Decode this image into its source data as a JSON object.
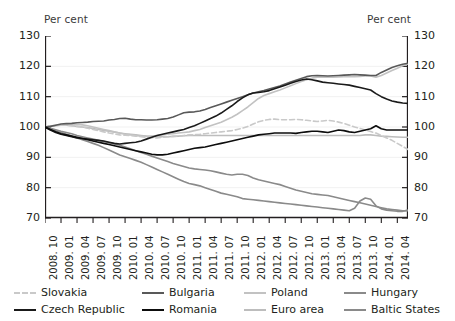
{
  "axis_titles": {
    "left": "Per cent",
    "right": "Per cent"
  },
  "legend": {
    "items": [
      {
        "label": "Slovakia",
        "color": "#c9c9c9",
        "dash": true,
        "row": 0,
        "col": 0
      },
      {
        "label": "Bulgaria",
        "color": "#595959",
        "dash": false,
        "row": 0,
        "col": 1
      },
      {
        "label": "Poland",
        "color": "#c2c2c2",
        "dash": false,
        "row": 0,
        "col": 2
      },
      {
        "label": "Hungary",
        "color": "#8a8a8a",
        "dash": false,
        "row": 0,
        "col": 3
      },
      {
        "label": "Czech Republic",
        "color": "#1a1a1a",
        "dash": false,
        "row": 1,
        "col": 0
      },
      {
        "label": "Romania",
        "color": "#0d0d0d",
        "dash": false,
        "row": 1,
        "col": 1
      },
      {
        "label": "Euro area",
        "color": "#bdbdbd",
        "dash": false,
        "row": 1,
        "col": 2
      },
      {
        "label": "Baltic States",
        "color": "#8a8a8a",
        "dash": false,
        "row": 1,
        "col": 3
      }
    ]
  },
  "chart_data": {
    "type": "line",
    "title": "",
    "xlabel": "",
    "ylabel": "Per cent",
    "ylim": [
      70,
      130
    ],
    "yticks": [
      70,
      80,
      90,
      100,
      110,
      120,
      130
    ],
    "grid": true,
    "legend_position": "bottom",
    "x": [
      "2008. 10",
      "2008. 11",
      "2008. 12",
      "2009. 01",
      "2009. 02",
      "2009. 03",
      "2009. 04",
      "2009. 05",
      "2009. 06",
      "2009. 07",
      "2009. 08",
      "2009. 09",
      "2009. 10",
      "2009. 11",
      "2009. 12",
      "2010. 01",
      "2010. 02",
      "2010. 03",
      "2010. 04",
      "2010. 05",
      "2010. 06",
      "2010. 07",
      "2010. 08",
      "2010. 09",
      "2010. 10",
      "2010. 11",
      "2010. 12",
      "2011. 01",
      "2011. 02",
      "2011. 03",
      "2011. 04",
      "2011. 05",
      "2011. 06",
      "2011. 07",
      "2011. 08",
      "2011. 09",
      "2011. 10",
      "2011. 11",
      "2011. 12",
      "2012. 01",
      "2012. 02",
      "2012. 03",
      "2012. 04",
      "2012. 05",
      "2012. 06",
      "2012. 07",
      "2012. 08",
      "2012. 09",
      "2012. 10",
      "2012. 11",
      "2012. 12",
      "2013. 01",
      "2013. 02",
      "2013. 03",
      "2013. 04",
      "2013. 05",
      "2013. 06",
      "2013. 07",
      "2013. 08",
      "2013. 09",
      "2013. 10",
      "2013. 11",
      "2013. 12",
      "2014. 01",
      "2014. 02",
      "2014. 03",
      "2014. 04",
      "2014. 05",
      "2014. 06"
    ],
    "xtick_labels": [
      "2008. 10",
      "2009. 01",
      "2009. 04",
      "2009. 07",
      "2009. 10",
      "2010. 01",
      "2010. 04",
      "2010. 07",
      "2010. 10",
      "2011. 01",
      "2011. 04",
      "2011. 07",
      "2011. 10",
      "2012. 01",
      "2012. 04",
      "2012. 07",
      "2012. 10",
      "2013. 01",
      "2013. 04",
      "2013. 07",
      "2013. 10",
      "2014. 01",
      "2014. 04"
    ],
    "xtick_indices": [
      0,
      3,
      6,
      9,
      12,
      15,
      18,
      21,
      24,
      27,
      30,
      33,
      36,
      39,
      42,
      45,
      48,
      51,
      54,
      57,
      60,
      63,
      66
    ],
    "series": [
      {
        "name": "Slovakia",
        "color": "#c9c9c9",
        "dash": true,
        "values": [
          100.0,
          100.3,
          100.6,
          100.7,
          100.6,
          100.4,
          100.2,
          100.0,
          99.6,
          99.2,
          98.8,
          98.4,
          98.0,
          97.7,
          97.4,
          97.3,
          97.2,
          97.0,
          96.8,
          96.6,
          96.5,
          96.4,
          96.6,
          96.8,
          96.9,
          97.0,
          97.2,
          97.4,
          97.5,
          97.6,
          97.8,
          98.0,
          98.2,
          98.4,
          98.6,
          98.8,
          99.2,
          99.6,
          100.2,
          101.0,
          101.7,
          102.2,
          102.5,
          102.6,
          102.4,
          102.4,
          102.4,
          102.5,
          102.4,
          102.2,
          102.0,
          101.8,
          102.0,
          102.2,
          102.0,
          101.6,
          101.2,
          100.6,
          100.0,
          99.5,
          99.0,
          98.5,
          98.0,
          97.2,
          96.4,
          95.6,
          94.6,
          93.6,
          92.6
        ]
      },
      {
        "name": "Bulgaria",
        "color": "#595959",
        "dash": false,
        "values": [
          100.0,
          100.2,
          100.6,
          101.0,
          101.1,
          101.2,
          101.4,
          101.5,
          101.6,
          101.8,
          101.9,
          102.0,
          102.3,
          102.5,
          102.8,
          102.9,
          102.6,
          102.4,
          102.4,
          102.3,
          102.3,
          102.4,
          102.6,
          102.8,
          103.3,
          104.0,
          104.7,
          104.9,
          105.0,
          105.3,
          105.8,
          106.4,
          107.0,
          107.6,
          108.2,
          108.8,
          109.4,
          110.0,
          110.6,
          111.2,
          111.6,
          112.0,
          112.5,
          113.0,
          113.5,
          114.2,
          114.8,
          115.4,
          116.0,
          116.6,
          116.9,
          117.0,
          116.9,
          116.8,
          116.9,
          117.0,
          117.1,
          117.2,
          117.3,
          117.2,
          117.1,
          117.0,
          117.0,
          118.0,
          118.8,
          119.6,
          120.2,
          120.7,
          121.0
        ]
      },
      {
        "name": "Poland",
        "color": "#c2c2c2",
        "dash": false,
        "values": [
          100.0,
          100.2,
          100.4,
          100.6,
          100.7,
          100.8,
          100.8,
          100.7,
          100.4,
          100.0,
          99.6,
          99.2,
          98.8,
          98.4,
          98.0,
          97.6,
          97.4,
          97.2,
          97.0,
          96.9,
          97.0,
          97.2,
          97.4,
          97.6,
          97.8,
          98.0,
          98.2,
          98.4,
          98.8,
          99.2,
          99.8,
          100.4,
          101.0,
          101.6,
          102.4,
          103.2,
          104.2,
          105.4,
          106.6,
          108.0,
          109.4,
          110.4,
          111.0,
          111.6,
          112.2,
          112.9,
          113.6,
          114.3,
          115.0,
          115.6,
          116.1,
          116.4,
          116.5,
          116.4,
          116.4,
          116.5,
          116.6,
          116.6,
          116.6,
          116.7,
          116.8,
          116.8,
          116.4,
          117.0,
          117.8,
          118.6,
          119.4,
          120.2,
          120.8
        ]
      },
      {
        "name": "Hungary",
        "color": "#8a8a8a",
        "dash": false,
        "values": [
          100.0,
          99.6,
          99.1,
          98.6,
          98.2,
          97.8,
          97.2,
          96.8,
          96.4,
          96.0,
          95.6,
          95.2,
          94.8,
          94.4,
          94.0,
          93.4,
          92.8,
          92.2,
          91.6,
          91.0,
          90.4,
          89.8,
          89.2,
          88.6,
          88.0,
          87.5,
          87.0,
          86.5,
          86.2,
          86.0,
          85.8,
          85.6,
          85.2,
          84.8,
          84.4,
          84.2,
          84.4,
          84.4,
          84.0,
          83.2,
          82.6,
          82.2,
          81.8,
          81.4,
          81.0,
          80.4,
          79.8,
          79.2,
          78.8,
          78.4,
          78.0,
          77.8,
          77.6,
          77.4,
          77.0,
          76.6,
          76.2,
          75.8,
          75.4,
          75.0,
          74.6,
          74.2,
          73.8,
          73.4,
          73.0,
          72.8,
          72.6,
          72.4,
          72.4
        ]
      },
      {
        "name": "Czech Republic",
        "color": "#1a1a1a",
        "dash": false,
        "values": [
          100.0,
          99.0,
          98.2,
          97.6,
          97.2,
          96.8,
          96.4,
          96.2,
          96.0,
          95.8,
          95.6,
          95.4,
          95.0,
          94.6,
          94.4,
          94.6,
          94.8,
          95.0,
          95.4,
          96.0,
          96.6,
          97.2,
          97.6,
          98.0,
          98.4,
          98.8,
          99.2,
          99.8,
          100.4,
          101.2,
          102.0,
          102.8,
          103.6,
          104.6,
          105.8,
          107.0,
          108.4,
          109.6,
          110.6,
          111.2,
          111.4,
          111.6,
          112.0,
          112.6,
          113.2,
          113.8,
          114.4,
          115.0,
          115.5,
          115.8,
          115.6,
          115.2,
          114.8,
          114.6,
          114.4,
          114.2,
          114.0,
          113.8,
          113.4,
          113.0,
          112.6,
          112.2,
          111.0,
          110.0,
          109.2,
          108.6,
          108.2,
          107.9,
          107.8
        ]
      },
      {
        "name": "Romania",
        "color": "#0d0d0d",
        "dash": false,
        "values": [
          100.0,
          99.2,
          98.4,
          97.8,
          97.4,
          97.0,
          96.6,
          96.2,
          95.8,
          95.4,
          95.0,
          94.6,
          94.2,
          93.8,
          93.4,
          93.0,
          92.6,
          92.2,
          91.8,
          91.4,
          91.0,
          90.8,
          90.8,
          91.0,
          91.4,
          91.8,
          92.2,
          92.6,
          93.0,
          93.2,
          93.4,
          93.8,
          94.2,
          94.6,
          95.0,
          95.4,
          95.8,
          96.2,
          96.6,
          97.0,
          97.4,
          97.6,
          97.8,
          98.0,
          98.0,
          98.0,
          98.0,
          97.9,
          98.2,
          98.4,
          98.6,
          98.6,
          98.4,
          98.2,
          98.6,
          99.0,
          98.8,
          98.4,
          98.2,
          98.6,
          99.0,
          99.4,
          100.4,
          99.4,
          99.0,
          99.0,
          99.0,
          99.0,
          99.0
        ]
      },
      {
        "name": "Euro area",
        "color": "#bdbdbd",
        "dash": false,
        "values": [
          100.0,
          100.2,
          100.5,
          100.7,
          100.6,
          100.4,
          100.2,
          100.0,
          99.8,
          99.5,
          99.2,
          98.9,
          98.6,
          98.3,
          98.0,
          97.8,
          97.6,
          97.4,
          97.2,
          97.0,
          96.9,
          96.8,
          96.8,
          96.8,
          96.9,
          97.0,
          97.1,
          97.2,
          97.2,
          97.2,
          97.2,
          97.2,
          97.2,
          97.2,
          97.2,
          97.2,
          97.2,
          97.2,
          97.2,
          97.2,
          97.2,
          97.2,
          97.2,
          97.2,
          97.2,
          97.2,
          97.2,
          97.2,
          97.2,
          97.2,
          97.2,
          97.2,
          97.2,
          97.2,
          97.2,
          97.2,
          97.2,
          97.2,
          97.2,
          97.2,
          97.4,
          97.4,
          97.2,
          97.0,
          96.9,
          96.8,
          96.7,
          96.6,
          96.6
        ]
      },
      {
        "name": "Baltic States",
        "color": "#8a8a8a",
        "dash": false,
        "values": [
          100.0,
          99.4,
          98.8,
          98.2,
          97.6,
          97.0,
          96.4,
          95.8,
          95.2,
          94.6,
          94.0,
          93.2,
          92.4,
          91.6,
          90.8,
          90.2,
          89.6,
          89.0,
          88.4,
          87.6,
          86.8,
          86.0,
          85.2,
          84.4,
          83.6,
          82.8,
          82.0,
          81.4,
          81.0,
          80.6,
          80.0,
          79.4,
          78.8,
          78.2,
          77.8,
          77.4,
          77.0,
          76.4,
          76.2,
          76.0,
          75.8,
          75.6,
          75.4,
          75.2,
          75.0,
          74.8,
          74.6,
          74.4,
          74.2,
          74.0,
          73.8,
          73.6,
          73.4,
          73.2,
          73.0,
          72.8,
          72.6,
          72.4,
          73.2,
          75.6,
          76.6,
          76.2,
          74.0,
          73.0,
          72.6,
          72.4,
          72.2,
          72.2,
          72.6
        ]
      }
    ]
  }
}
